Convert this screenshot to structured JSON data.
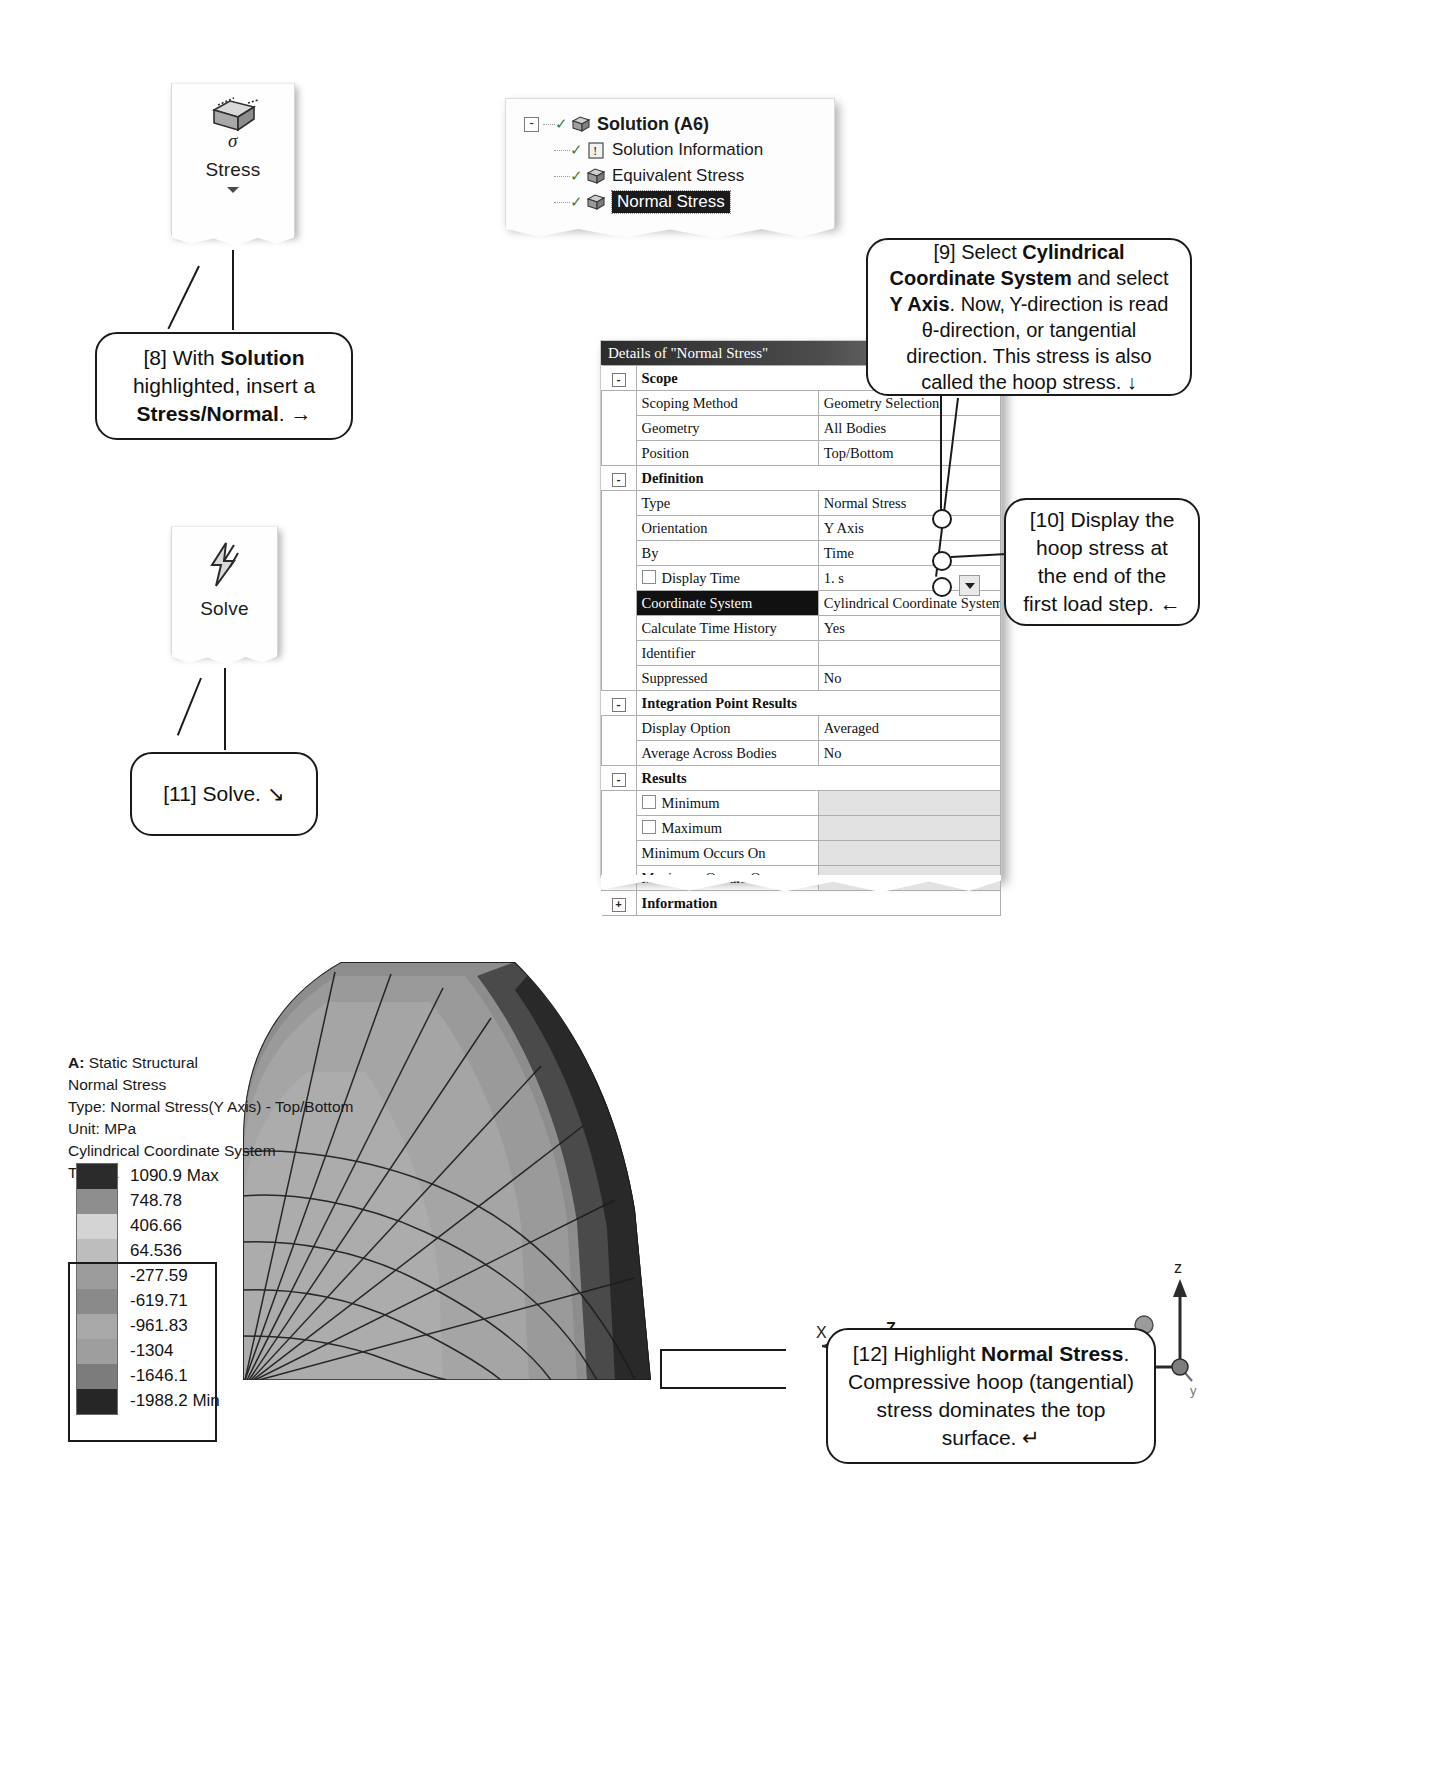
{
  "ribbon": {
    "stress": {
      "label": "Stress",
      "icon": "stress-cube-icon",
      "caret": "dropdown-caret"
    },
    "solve": {
      "label": "Solve",
      "icon": "lightning-bolt-icon"
    }
  },
  "tree": {
    "items": [
      {
        "label": "Solution (A6)",
        "icon": "solution-icon",
        "level": 0,
        "selected": false,
        "bold": true
      },
      {
        "label": "Solution Information",
        "icon": "solution-information-icon",
        "level": 1,
        "selected": false,
        "bold": false
      },
      {
        "label": "Equivalent Stress",
        "icon": "stress-result-icon",
        "level": 1,
        "selected": false,
        "bold": false
      },
      {
        "label": "Normal Stress",
        "icon": "stress-result-icon",
        "level": 1,
        "selected": true,
        "bold": false
      }
    ],
    "expander": "-"
  },
  "details": {
    "title": "Details of \"Normal Stress\"",
    "rows": [
      {
        "kind": "group",
        "label": "Scope",
        "expander": "-"
      },
      {
        "kind": "row",
        "label": "Scoping Method",
        "value": "Geometry Selection"
      },
      {
        "kind": "row",
        "label": "Geometry",
        "value": "All Bodies"
      },
      {
        "kind": "row",
        "label": "Position",
        "value": "Top/Bottom"
      },
      {
        "kind": "group",
        "label": "Definition",
        "expander": "-"
      },
      {
        "kind": "row",
        "label": "Type",
        "value": "Normal Stress"
      },
      {
        "kind": "row",
        "label": "Orientation",
        "value": "Y Axis"
      },
      {
        "kind": "row",
        "label": "By",
        "value": "Time"
      },
      {
        "kind": "check",
        "label": "Display Time",
        "value": "1. s",
        "checked": false
      },
      {
        "kind": "row",
        "label": "Coordinate System",
        "value": "Cylindrical Coordinate System",
        "selected": true,
        "dropdown": true
      },
      {
        "kind": "row",
        "label": "Calculate Time History",
        "value": "Yes"
      },
      {
        "kind": "row",
        "label": "Identifier",
        "value": ""
      },
      {
        "kind": "row",
        "label": "Suppressed",
        "value": "No"
      },
      {
        "kind": "group",
        "label": "Integration Point Results",
        "expander": "-"
      },
      {
        "kind": "row",
        "label": "Display Option",
        "value": "Averaged"
      },
      {
        "kind": "row",
        "label": "Average Across Bodies",
        "value": "No"
      },
      {
        "kind": "group",
        "label": "Results",
        "expander": "-"
      },
      {
        "kind": "check",
        "label": "Minimum",
        "value": "",
        "checked": false,
        "shade": true
      },
      {
        "kind": "check",
        "label": "Maximum",
        "value": "",
        "checked": false,
        "shade": true
      },
      {
        "kind": "row",
        "label": "Minimum Occurs On",
        "value": "",
        "shade": true
      },
      {
        "kind": "row",
        "label": "Maximum Occurs On",
        "value": "",
        "shade": true
      },
      {
        "kind": "group",
        "label": "Information",
        "expander": "+"
      }
    ]
  },
  "callouts": [
    {
      "id": "callout-8",
      "html": "[8] With <b>Solution</b> highlighted, insert a <b>Stress/Normal</b>. &#8594;"
    },
    {
      "id": "callout-9",
      "html": "[9] Select <b>Cylindrical Coordinate System</b> and select <b>Y Axis</b>.  Now,&thinsp;Y-direction is read &theta;-direction, or tangential direction. This stress is also called the hoop stress. &#8595;"
    },
    {
      "id": "callout-10",
      "html": "[10] Display the hoop stress at the end of the first load step. &#8592;"
    },
    {
      "id": "callout-11",
      "html": "[11] Solve. &#8600;"
    },
    {
      "id": "callout-12",
      "html": "[12] Highlight <b>Normal Stress</b>.  Compressive hoop (tangential) stress dominates the top surface. &#8629;"
    }
  ],
  "result_header": {
    "line1_bold": "A:",
    "line1_rest": " Static Structural",
    "line2": "Normal Stress",
    "line3": "Type: Normal Stress(Y Axis) - Top/Bottom",
    "line4": "Unit: MPa",
    "line5": "Cylindrical Coordinate System",
    "line6": "Time: 1"
  },
  "chart_data": {
    "type": "heatmap",
    "subtitle": "Type: Normal Stress(Y Axis) - Top/Bottom",
    "unit": "MPa",
    "coordinate_system": "Cylindrical Coordinate System",
    "time": 1,
    "legend_position": "left",
    "legend_labels": [
      "1090.9 Max",
      "748.78",
      "406.66",
      "64.536",
      "-277.59",
      "-619.71",
      "-961.83",
      "-1304",
      "-1646.1",
      "-1988.2 Min"
    ],
    "legend_values": [
      1090.9,
      748.78,
      406.66,
      64.536,
      -277.59,
      -619.71,
      -961.83,
      -1304,
      -1646.1,
      -1988.2
    ],
    "legend_colors": [
      "#2b2b2b",
      "#8e8e8e",
      "#d4d4d4",
      "#bdbdbd",
      "#9c9c9c",
      "#8a8a8a",
      "#a8a8a8",
      "#9e9e9e",
      "#7c7c7c",
      "#262626"
    ],
    "max": 1090.9,
    "min": -1988.2,
    "max_label": "Max",
    "min_label": "Min"
  },
  "triads": {
    "left": {
      "axes": [
        "X",
        "Z",
        "Y"
      ],
      "name": "rotation-triad"
    },
    "right": {
      "axes": [
        "Z",
        "X",
        "Y"
      ],
      "name": "global-triad"
    }
  }
}
